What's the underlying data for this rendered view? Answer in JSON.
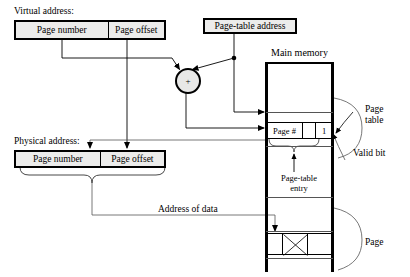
{
  "diagram": {
    "labels": {
      "virtual_address": "Virtual address:",
      "physical_address": "Physical address:",
      "page_table_address": "Page-table address",
      "main_memory": "Main memory",
      "page_table": "Page\ntable",
      "valid_bit": "Valid bit",
      "page_table_entry": "Page-table\nentry",
      "page": "Page",
      "address_of_data": "Address of data",
      "adder_symbol": "+"
    },
    "virtual_address_box": {
      "fields": [
        {
          "name": "page-number",
          "label": "Page number"
        },
        {
          "name": "page-offset",
          "label": "Page offset"
        }
      ]
    },
    "physical_address_box": {
      "fields": [
        {
          "name": "page-number",
          "label": "Page number"
        },
        {
          "name": "page-offset",
          "label": "Page offset"
        }
      ]
    },
    "page_table_entry_row": {
      "fields": [
        {
          "name": "page-number-field",
          "label": "Page #"
        },
        {
          "name": "spacer-field",
          "label": ""
        },
        {
          "name": "valid-bit-field",
          "label": "1"
        }
      ]
    },
    "colors": {
      "box_fill": "#ececeb",
      "stroke": "#000000",
      "rule": "#555555",
      "adder_fill": "#e8e8e7"
    }
  }
}
